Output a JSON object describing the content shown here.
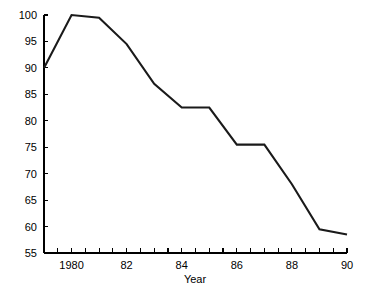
{
  "chart_data": {
    "type": "line",
    "title": "",
    "subtitle": "",
    "xlabel": "Year",
    "ylabel": "",
    "xlim": [
      1979,
      1990
    ],
    "ylim": [
      55,
      100
    ],
    "grid": false,
    "legend": null,
    "x": [
      1979,
      1980,
      1981,
      1982,
      1983,
      1984,
      1985,
      1986,
      1987,
      1988,
      1989,
      1990
    ],
    "values": [
      90,
      100,
      99.5,
      94.5,
      87,
      82.5,
      82.5,
      75.5,
      75.5,
      68,
      59.5,
      58.5
    ],
    "series": [
      {
        "name": "series-1",
        "color": "#1a1a1a",
        "values": [
          90,
          100,
          99.5,
          94.5,
          87,
          82.5,
          82.5,
          75.5,
          75.5,
          68,
          59.5,
          58.5
        ]
      }
    ],
    "y_ticks": [
      55,
      60,
      65,
      70,
      75,
      80,
      85,
      90,
      95,
      100
    ],
    "y_tick_labels": [
      "55",
      "60",
      "65",
      "70",
      "75",
      "80",
      "85",
      "90",
      "95",
      "100"
    ],
    "x_ticks": [
      1979,
      1979.5,
      1980,
      1980.5,
      1981,
      1981.5,
      1982,
      1982.5,
      1983,
      1983.5,
      1984,
      1984.5,
      1985,
      1985.5,
      1986,
      1986.5,
      1987,
      1987.5,
      1988,
      1988.5,
      1989,
      1989.5,
      1990
    ],
    "x_labeled_ticks": [
      1980,
      1982,
      1984,
      1986,
      1988,
      1990
    ],
    "x_tick_labels": [
      "1980",
      "82",
      "84",
      "86",
      "88",
      "90"
    ]
  },
  "axis": {
    "line_color": "#000000",
    "label_color": "#000000"
  },
  "plot": {
    "background": "#ffffff"
  }
}
